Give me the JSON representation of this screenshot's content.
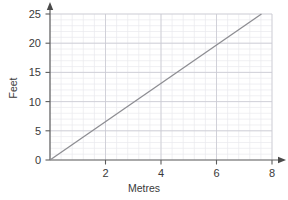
{
  "chart_data": {
    "type": "line",
    "title": "",
    "xlabel": "Metres",
    "ylabel": "Feet",
    "xlim": [
      0,
      8
    ],
    "ylim": [
      0,
      25
    ],
    "x_major_ticks": [
      2,
      4,
      6,
      8
    ],
    "x_tick_labels": [
      "2",
      "4",
      "6",
      "8"
    ],
    "y_major_ticks": [
      0,
      5,
      10,
      15,
      20,
      25
    ],
    "y_tick_labels": [
      "0",
      "5",
      "10",
      "15",
      "20",
      "25"
    ],
    "x_minor_step": 0.4,
    "y_minor_step": 1,
    "grid": true,
    "legend": false,
    "origin_label": "0",
    "series": [
      {
        "name": "Metres to Feet conversion",
        "points": [
          {
            "x": 0,
            "y": 0
          },
          {
            "x": 7.62,
            "y": 25
          }
        ],
        "slope_feet_per_metre": 3.28,
        "color": "#8d8d92"
      }
    ],
    "reference_values": [
      {
        "x": 1,
        "y": 3.28
      },
      {
        "x": 2,
        "y": 6.56
      },
      {
        "x": 3,
        "y": 9.84
      },
      {
        "x": 4,
        "y": 13.12
      },
      {
        "x": 5,
        "y": 16.4
      },
      {
        "x": 6,
        "y": 19.69
      },
      {
        "x": 7,
        "y": 22.97
      },
      {
        "x": 7.62,
        "y": 25
      }
    ]
  },
  "style": {
    "minor_grid_color": "#e9e9ee",
    "major_grid_color": "#c9c9d2",
    "axis_color": "#5c5c5c",
    "text_color": "#3a3a3a",
    "background": "#ffffff"
  }
}
